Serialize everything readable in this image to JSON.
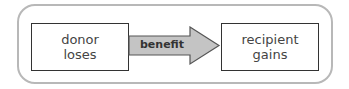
{
  "diagram": {
    "donor": {
      "line1": "donor",
      "line2": "loses"
    },
    "arrow": {
      "label": "benefit",
      "fill": "#c4c4c4",
      "stroke": "#555555"
    },
    "recipient": {
      "line1": "recipient",
      "line2": "gains"
    },
    "frame_color": "#b8b8b8"
  }
}
